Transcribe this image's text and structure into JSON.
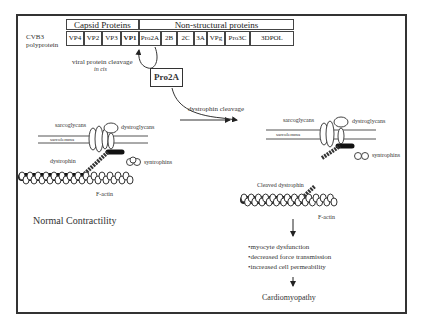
{
  "polyprotein": {
    "label_line1": "CVB3",
    "label_line2": "polyprotein",
    "capsid_header": "Capsid Proteins",
    "nonstructural_header": "Non-structural proteins",
    "segments": [
      "VP4",
      "VP2",
      "VP3",
      "VP1",
      "Pro2A",
      "2B",
      "2C",
      "3A",
      "VPg",
      "Pro3C",
      "3DPOL"
    ]
  },
  "cleavage": {
    "viral_line1": "viral protein cleavage",
    "viral_line2": "in cis",
    "protease_box": "Pro2A",
    "dystrophin_cleavage": "dystrophin cleavage"
  },
  "normal": {
    "sarcoglycans": "sarcoglycans",
    "dystroglycans": "dystroglycans",
    "sarcolemma": "sarcolemma",
    "dystrophin": "dystrophin",
    "syntrophins": "syntrophins",
    "factin": "F-actin",
    "alpha": "α",
    "beta": "β",
    "title": "Normal Contractility"
  },
  "cleaved": {
    "sarcoglycans": "sarcoglycans",
    "dystroglycans": "dystroglycans",
    "sarcolemma": "sarcolemma",
    "syntrophins": "syntrophins",
    "cleaved_dystrophin": "Cleaved dystrophin",
    "factin": "F-actin",
    "alpha": "α"
  },
  "outcomes": {
    "items": [
      "•myocyte dysfunction",
      "•decreased force transmission",
      "•increased cell permeability"
    ],
    "result": "Cardiomyopathy"
  }
}
